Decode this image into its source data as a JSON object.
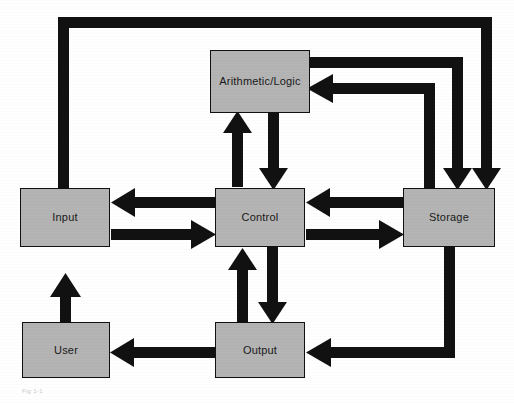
{
  "diagram": {
    "caption": "Fig 1-1",
    "colors": {
      "box_fill": "#b4b4b4",
      "box_border": "#111111",
      "arrow": "#111111",
      "background": "#ffffff",
      "label_text": "#1a1a1a"
    },
    "nodes": [
      {
        "id": "alu",
        "label": "Arithmetic/Logic",
        "x": 210,
        "y": 50,
        "w": 100,
        "h": 63
      },
      {
        "id": "input",
        "label": "Input",
        "x": 20,
        "y": 188,
        "w": 90,
        "h": 59
      },
      {
        "id": "control",
        "label": "Control",
        "x": 215,
        "y": 188,
        "w": 90,
        "h": 59
      },
      {
        "id": "storage",
        "label": "Storage",
        "x": 403,
        "y": 188,
        "w": 92,
        "h": 59
      },
      {
        "id": "user",
        "label": "User",
        "x": 22,
        "y": 322,
        "w": 88,
        "h": 56
      },
      {
        "id": "output",
        "label": "Output",
        "x": 215,
        "y": 322,
        "w": 90,
        "h": 56
      }
    ],
    "edges": [
      {
        "id": "input-to-storage-top",
        "from": "input",
        "to": "storage",
        "direction": "one-way",
        "route": "input-top up, across top, down into storage-top"
      },
      {
        "id": "alu-to-storage",
        "from": "alu",
        "to": "storage",
        "direction": "one-way",
        "route": "alu-right, across, down into storage-top"
      },
      {
        "id": "storage-to-alu",
        "from": "storage",
        "to": "alu",
        "direction": "one-way",
        "route": "storage-top up, across, left into alu-right"
      },
      {
        "id": "alu-to-control",
        "from": "alu",
        "to": "control",
        "direction": "one-way",
        "route": "alu-bottom down into control-top"
      },
      {
        "id": "control-to-alu",
        "from": "control",
        "to": "alu",
        "direction": "one-way",
        "route": "control-top up into alu-bottom"
      },
      {
        "id": "storage-to-control",
        "from": "storage",
        "to": "control",
        "direction": "one-way",
        "route": "storage-left to control-right upper"
      },
      {
        "id": "control-to-storage",
        "from": "control",
        "to": "storage",
        "direction": "one-way",
        "route": "control-right lower to storage-left"
      },
      {
        "id": "control-to-input",
        "from": "control",
        "to": "input",
        "direction": "one-way",
        "route": "control-left to input-right upper"
      },
      {
        "id": "input-to-control",
        "from": "input",
        "to": "control",
        "direction": "one-way",
        "route": "input-right lower to control-left"
      },
      {
        "id": "control-to-output",
        "from": "control",
        "to": "output",
        "direction": "one-way",
        "route": "control-bottom down into output-top"
      },
      {
        "id": "output-to-control",
        "from": "output",
        "to": "control",
        "direction": "one-way",
        "route": "output-top up into control-bottom"
      },
      {
        "id": "user-to-input",
        "from": "user",
        "to": "input",
        "direction": "one-way",
        "route": "user-top up into input-bottom"
      },
      {
        "id": "output-to-user",
        "from": "output",
        "to": "user",
        "direction": "one-way",
        "route": "output-left to user-right"
      },
      {
        "id": "storage-to-output",
        "from": "storage",
        "to": "output",
        "direction": "one-way",
        "route": "storage-bottom down, across left into output-right"
      }
    ]
  }
}
